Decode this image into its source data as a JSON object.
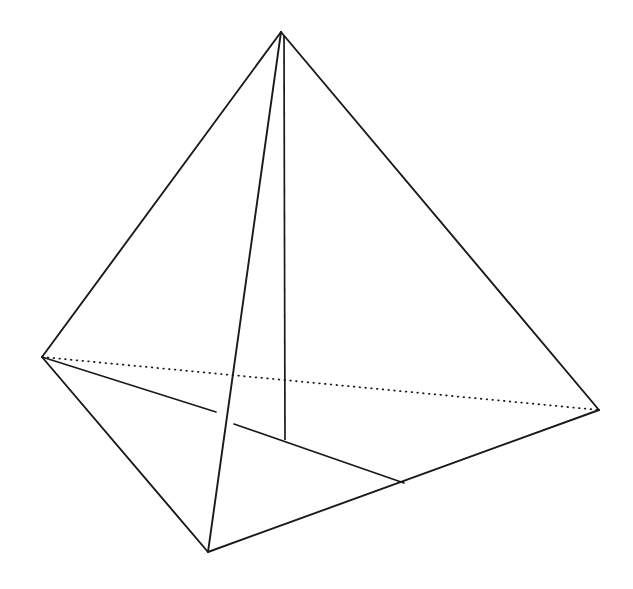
{
  "figure": {
    "kind": "3d-solid-wireframe",
    "shape_name": "tetrahedron",
    "background_color": "#ffffff",
    "stroke_color": "#1a1a1a",
    "canvas": {
      "width": 633,
      "height": 589
    },
    "vertices": [
      {
        "id": "apex",
        "label": "apex",
        "x": 281,
        "y": 32
      },
      {
        "id": "left",
        "label": "left-base",
        "x": 42,
        "y": 357
      },
      {
        "id": "right",
        "label": "right-base",
        "x": 599,
        "y": 410
      },
      {
        "id": "front",
        "label": "front-base",
        "x": 208,
        "y": 552
      }
    ],
    "edges": [
      {
        "id": "apex-left",
        "from": "apex",
        "to": "left",
        "style": "solid",
        "d": "M 281 32 L 42 357"
      },
      {
        "id": "apex-right",
        "from": "apex",
        "to": "right",
        "style": "solid",
        "d": "M 281 32 L 599 410"
      },
      {
        "id": "apex-front",
        "from": "apex",
        "to": "front",
        "style": "solid",
        "d": "M 281 32 L 208 552"
      },
      {
        "id": "left-front",
        "from": "left",
        "to": "front",
        "style": "solid",
        "d": "M 42 357 L 208 552"
      },
      {
        "id": "front-right",
        "from": "front",
        "to": "right",
        "style": "solid",
        "d": "M 208 552 L 599 410"
      },
      {
        "id": "left-right",
        "from": "left",
        "to": "right",
        "style": "hidden-dotted",
        "d": "M 42 357 L 599 410"
      }
    ],
    "interior_lines": [
      {
        "id": "median-left-segment",
        "style": "solid",
        "note": "from left vertex toward base centre, broken where it passes behind",
        "d": "M 42 357 L 216 412"
      },
      {
        "id": "median-right-segment",
        "style": "solid",
        "note": "continues from occlusion gap to the front-right base edge",
        "d": "M 234 424 L 404 483"
      },
      {
        "id": "altitude",
        "style": "solid",
        "note": "vertical altitude from apex to base centre",
        "d": "M 284 36 L 285 440"
      }
    ],
    "occlusion_gap": {
      "from_x": 216,
      "from_y": 412,
      "to_x": 234,
      "to_y": 424
    },
    "altitude_foot": {
      "x": 285,
      "y": 440
    }
  }
}
